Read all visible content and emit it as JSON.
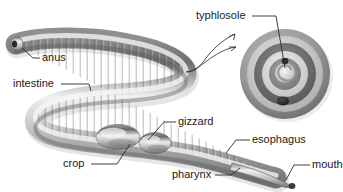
{
  "figure": {
    "background_color": "#ffffff",
    "text_color": "#1a1a1a",
    "body_fill_light": "#e8e8e8",
    "body_fill_mid": "#a8a8a8",
    "body_fill_dark": "#6e6e6e",
    "outline_color": "#555555"
  },
  "labels": {
    "anus": "anus",
    "intestine": "intestine",
    "typhlosole": "typhlosole",
    "gizzard": "gizzard",
    "crop": "crop",
    "esophagus": "esophagus",
    "pharynx": "pharynx",
    "mouth": "mouth"
  },
  "cross_section": {
    "name": "intestine-cross-section",
    "ring_colors": [
      "#9a9a9a",
      "#cfcfcf",
      "#6f6f6f",
      "#d8d8d8",
      "#8a8a8a",
      "#efefef",
      "#777777"
    ],
    "has_typhlosole_fold": true,
    "has_ventral_vessel_spot": true
  },
  "callout": {
    "arrow_count": 2,
    "direction": "worm-to-cross-section"
  }
}
